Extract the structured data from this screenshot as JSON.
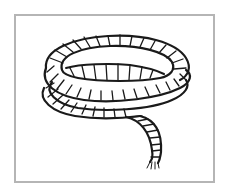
{
  "illustration": {
    "subject": "coiled rope",
    "style": "black line art",
    "frame_color": "#b5b5b5",
    "stroke_color": "#1a1a1a",
    "background": "#ffffff"
  }
}
